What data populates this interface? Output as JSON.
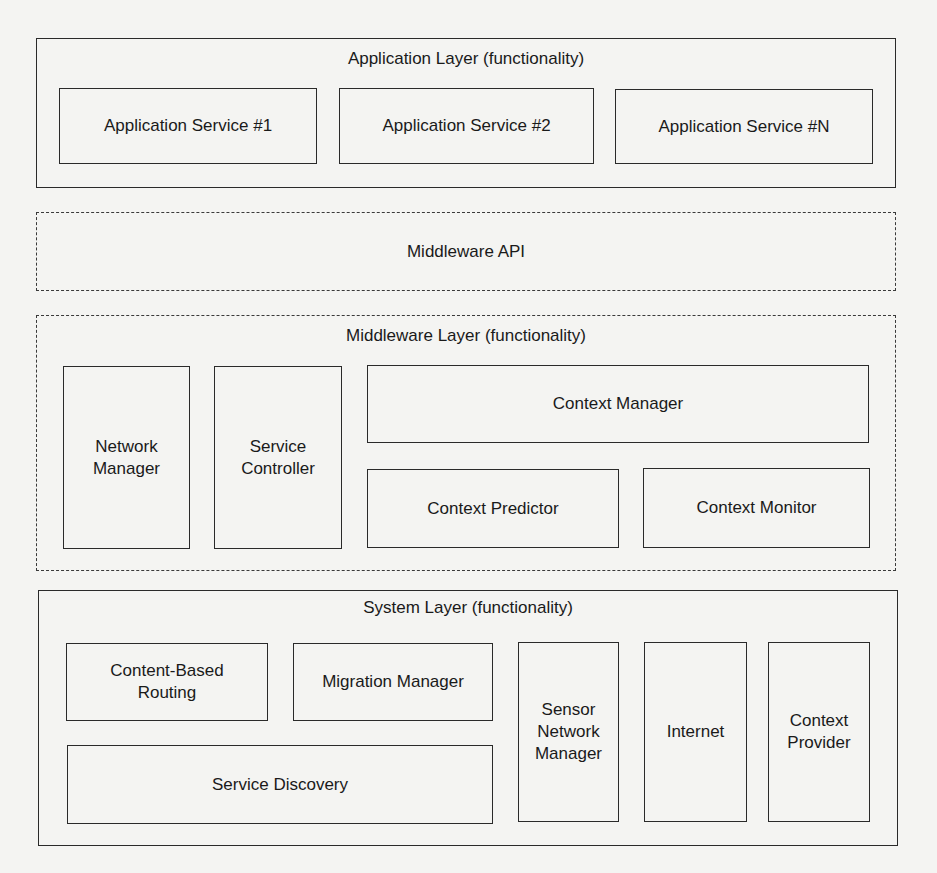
{
  "application_layer": {
    "title": "Application Layer (functionality)",
    "services": [
      "Application Service #1",
      "Application Service #2",
      "Application Service #N"
    ]
  },
  "middleware_api": {
    "title": "Middleware API"
  },
  "middleware_layer": {
    "title": "Middleware Layer (functionality)",
    "network_manager": "Network\nManager",
    "service_controller": "Service\nController",
    "context_manager": "Context Manager",
    "context_predictor": "Context Predictor",
    "context_monitor": "Context Monitor"
  },
  "system_layer": {
    "title": "System Layer (functionality)",
    "content_based_routing": "Content-Based\nRouting",
    "migration_manager": "Migration Manager",
    "service_discovery": "Service Discovery",
    "sensor_network_manager": "Sensor\nNetwork\nManager",
    "internet": "Internet",
    "context_provider": "Context\nProvider"
  }
}
